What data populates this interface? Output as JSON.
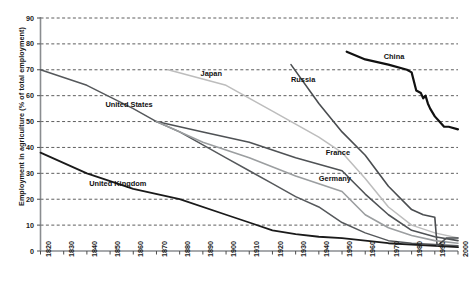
{
  "chart_data": {
    "type": "line",
    "title": "",
    "xlabel": "",
    "ylabel": "Employment in agriculture (% of total employment)",
    "xlim": [
      1820,
      2000
    ],
    "ylim": [
      0,
      90
    ],
    "grid": true,
    "legend_position": "inline-labels",
    "yticks": [
      90,
      80,
      70,
      60,
      50,
      40,
      30,
      20,
      10,
      0
    ],
    "xticks": [
      1820,
      1830,
      1840,
      1850,
      1860,
      1870,
      1880,
      1890,
      1900,
      1910,
      1920,
      1930,
      1940,
      1950,
      1960,
      1970,
      1980,
      1990,
      2000
    ],
    "series": [
      {
        "name": "United States",
        "color": "#55585b",
        "width": 1.5,
        "label_x": 1848,
        "label_y": 56.5,
        "points": [
          [
            1820,
            70
          ],
          [
            1840,
            64
          ],
          [
            1860,
            55
          ],
          [
            1870,
            50
          ],
          [
            1880,
            46
          ],
          [
            1890,
            41
          ],
          [
            1900,
            36
          ],
          [
            1910,
            31
          ],
          [
            1920,
            26
          ],
          [
            1930,
            21
          ],
          [
            1940,
            17
          ],
          [
            1950,
            11
          ],
          [
            1960,
            7
          ],
          [
            1970,
            4
          ],
          [
            1980,
            3
          ],
          [
            1990,
            2.5
          ],
          [
            2000,
            2
          ]
        ]
      },
      {
        "name": "United Kingdom",
        "color": "#1a1a1a",
        "width": 1.8,
        "label_x": 1841,
        "label_y": 26,
        "points": [
          [
            1820,
            38
          ],
          [
            1840,
            30
          ],
          [
            1860,
            24
          ],
          [
            1880,
            20
          ],
          [
            1900,
            14
          ],
          [
            1910,
            11
          ],
          [
            1920,
            8
          ],
          [
            1930,
            6.5
          ],
          [
            1940,
            5.5
          ],
          [
            1950,
            5
          ],
          [
            1960,
            4
          ],
          [
            1970,
            3
          ],
          [
            1980,
            2.5
          ],
          [
            1990,
            2
          ],
          [
            2000,
            1.5
          ]
        ]
      },
      {
        "name": "Japan",
        "color": "#bdbdbd",
        "width": 1.5,
        "label_x": 1889,
        "label_y": 68.5,
        "points": [
          [
            1875,
            70
          ],
          [
            1900,
            64
          ],
          [
            1920,
            54
          ],
          [
            1940,
            44
          ],
          [
            1950,
            38
          ],
          [
            1960,
            28
          ],
          [
            1970,
            17
          ],
          [
            1980,
            10
          ],
          [
            1990,
            7
          ],
          [
            2000,
            5
          ]
        ]
      },
      {
        "name": "Russia",
        "color": "#4a4d50",
        "width": 1.6,
        "label_x": 1928,
        "label_y": 66,
        "points": [
          [
            1928,
            72
          ],
          [
            1940,
            57
          ],
          [
            1950,
            46
          ],
          [
            1960,
            37
          ],
          [
            1970,
            25
          ],
          [
            1980,
            16
          ],
          [
            1985,
            14
          ],
          [
            1990,
            13
          ],
          [
            1991,
            2
          ],
          [
            1995,
            5
          ],
          [
            2000,
            5
          ]
        ]
      },
      {
        "name": "China",
        "color": "#111111",
        "width": 2.2,
        "label_x": 1968,
        "label_y": 75,
        "points": [
          [
            1952,
            77
          ],
          [
            1960,
            74
          ],
          [
            1970,
            72
          ],
          [
            1978,
            70
          ],
          [
            1980,
            69
          ],
          [
            1982,
            62
          ],
          [
            1984,
            61
          ],
          [
            1985,
            59
          ],
          [
            1986,
            60
          ],
          [
            1987,
            57
          ],
          [
            1988,
            55
          ],
          [
            1990,
            52
          ],
          [
            1992,
            50
          ],
          [
            1994,
            48
          ],
          [
            1996,
            48
          ],
          [
            2000,
            47
          ]
        ]
      },
      {
        "name": "France",
        "color": "#4f5255",
        "width": 1.6,
        "label_x": 1943,
        "label_y": 38,
        "points": [
          [
            1870,
            50
          ],
          [
            1890,
            46
          ],
          [
            1910,
            42
          ],
          [
            1930,
            36
          ],
          [
            1950,
            31
          ],
          [
            1960,
            22
          ],
          [
            1970,
            14
          ],
          [
            1980,
            8
          ],
          [
            1990,
            5.5
          ],
          [
            2000,
            4
          ]
        ]
      },
      {
        "name": "Germany",
        "color": "#9b9ea0",
        "width": 1.6,
        "label_x": 1940,
        "label_y": 28,
        "points": [
          [
            1870,
            50
          ],
          [
            1890,
            42
          ],
          [
            1910,
            36
          ],
          [
            1930,
            29
          ],
          [
            1950,
            23
          ],
          [
            1960,
            14
          ],
          [
            1970,
            9
          ],
          [
            1980,
            6
          ],
          [
            1990,
            4
          ],
          [
            2000,
            3
          ]
        ]
      }
    ]
  }
}
